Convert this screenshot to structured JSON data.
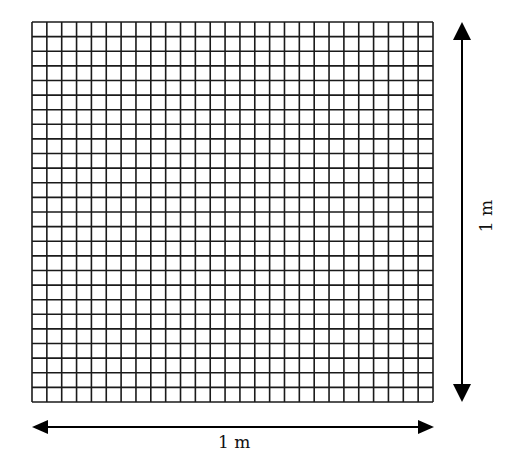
{
  "diagram": {
    "grid": {
      "columns": 27,
      "rows": 26,
      "line_color": "#1a1a1a"
    },
    "width_label": "1 m",
    "height_label": "1 m",
    "arrow_color": "#000000"
  }
}
